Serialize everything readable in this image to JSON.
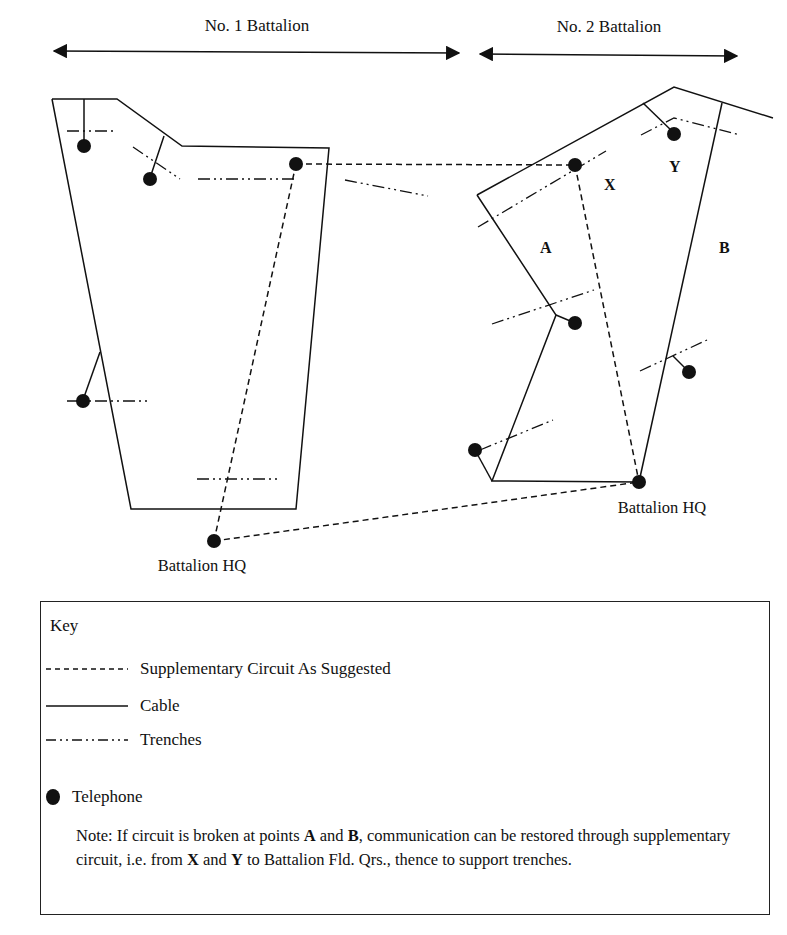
{
  "headers": {
    "battalion_1": "No. 1 Battalion",
    "battalion_2": "No. 2 Battalion"
  },
  "labels": {
    "hq_1": "Battalion HQ",
    "hq_2": "Battalion HQ",
    "point_a": "A",
    "point_b": "B",
    "point_x": "X",
    "point_y": "Y"
  },
  "key": {
    "title": "Key",
    "items": [
      {
        "line_style": "dashed",
        "label": "Supplementary Circuit As Suggested"
      },
      {
        "line_style": "solid",
        "label": "Cable"
      },
      {
        "line_style": "dash-dot-dot",
        "label": "Trenches"
      }
    ],
    "telephone_label": "Telephone",
    "note": {
      "prefix": "Note: If circuit is broken at points ",
      "a": "A",
      "and1": " and ",
      "b": "B",
      "mid": ", communication can be restored through supplementary circuit, i.e. from ",
      "x": "X",
      "and2": " and ",
      "y": "Y",
      "suffix": " to Battalion Fld. Qrs., thence to support trenches."
    }
  },
  "colors": {
    "ink": "#111111",
    "background": "#ffffff"
  }
}
